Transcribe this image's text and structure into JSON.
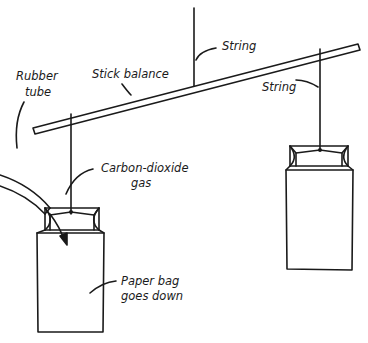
{
  "diagram": {
    "title": "",
    "labels": {
      "string_top": "String",
      "stick_balance": "Stick balance",
      "string_right": "String",
      "rubber_tube_line1": "Rubber",
      "rubber_tube_line2": "tube",
      "co2_line1": "Carbon-dioxide",
      "co2_line2": "gas",
      "paper_bag_line1": "Paper bag",
      "paper_bag_line2": "goes down"
    },
    "colors": {
      "ink": "#1a1a1a",
      "background": "#ffffff"
    }
  }
}
